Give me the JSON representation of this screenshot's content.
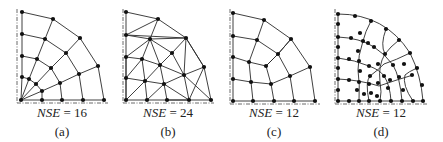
{
  "panels": [
    {
      "id": "a",
      "nse_label": "NSE",
      "nse_value": "= 16",
      "caption": "(a)",
      "label_center_x": 62
    },
    {
      "id": "b",
      "nse_label": "NSE",
      "nse_value": "= 24",
      "caption": "(b)",
      "label_center_x": 168
    },
    {
      "id": "c",
      "nse_label": "NSE",
      "nse_value": "= 12",
      "caption": "(c)",
      "label_center_x": 274
    },
    {
      "id": "d",
      "nse_label": "NSE",
      "nse_value": "= 12",
      "caption": "(d)",
      "label_center_x": 381
    }
  ],
  "meshes": {
    "a": {
      "axes": [
        [
          17,
          9,
          17,
          103
        ],
        [
          17,
          103,
          108,
          103
        ]
      ],
      "nodes": [
        [
          21,
          100
        ],
        [
          22,
          12
        ],
        [
          22,
          34
        ],
        [
          22,
          56
        ],
        [
          22,
          77
        ],
        [
          42,
          100
        ],
        [
          62,
          100
        ],
        [
          83,
          100
        ],
        [
          104,
          100
        ],
        [
          53,
          19
        ],
        [
          80,
          38
        ],
        [
          98,
          66
        ],
        [
          45,
          39
        ],
        [
          66,
          53
        ],
        [
          79,
          74
        ],
        [
          37,
          59
        ],
        [
          51,
          68
        ],
        [
          60,
          83
        ],
        [
          29,
          79
        ],
        [
          36,
          84
        ],
        [
          42,
          91
        ]
      ],
      "edges": [
        [
          1,
          2
        ],
        [
          2,
          3
        ],
        [
          3,
          4
        ],
        [
          4,
          0
        ],
        [
          0,
          5
        ],
        [
          5,
          6
        ],
        [
          6,
          7
        ],
        [
          7,
          8
        ],
        [
          1,
          9
        ],
        [
          9,
          10
        ],
        [
          10,
          11
        ],
        [
          11,
          8
        ],
        [
          2,
          12
        ],
        [
          12,
          13
        ],
        [
          13,
          14
        ],
        [
          14,
          7
        ],
        [
          3,
          15
        ],
        [
          15,
          16
        ],
        [
          16,
          17
        ],
        [
          17,
          6
        ],
        [
          4,
          18
        ],
        [
          18,
          19
        ],
        [
          19,
          20
        ],
        [
          20,
          5
        ],
        [
          9,
          12
        ],
        [
          12,
          15
        ],
        [
          15,
          18
        ],
        [
          18,
          0
        ],
        [
          10,
          13
        ],
        [
          13,
          16
        ],
        [
          16,
          19
        ],
        [
          19,
          0
        ],
        [
          11,
          14
        ],
        [
          14,
          17
        ],
        [
          17,
          20
        ],
        [
          20,
          0
        ]
      ]
    },
    "b": {
      "axes": [
        [
          123,
          9,
          123,
          103
        ],
        [
          123,
          103,
          214,
          103
        ]
      ],
      "nodes": [
        [
          126,
          12
        ],
        [
          126,
          35
        ],
        [
          126,
          57
        ],
        [
          126,
          78
        ],
        [
          126,
          100
        ],
        [
          147,
          100
        ],
        [
          167,
          100
        ],
        [
          189,
          100
        ],
        [
          211,
          100
        ],
        [
          158,
          19
        ],
        [
          186,
          38
        ],
        [
          204,
          67
        ],
        [
          150,
          39
        ],
        [
          172,
          53
        ],
        [
          142,
          59
        ],
        [
          160,
          65
        ],
        [
          184,
          75
        ],
        [
          145,
          81
        ],
        [
          164,
          84
        ]
      ],
      "edges": [
        [
          0,
          1
        ],
        [
          1,
          2
        ],
        [
          2,
          3
        ],
        [
          3,
          4
        ],
        [
          4,
          5
        ],
        [
          5,
          6
        ],
        [
          6,
          7
        ],
        [
          7,
          8
        ],
        [
          0,
          9
        ],
        [
          9,
          10
        ],
        [
          10,
          11
        ],
        [
          11,
          8
        ],
        [
          1,
          9
        ],
        [
          1,
          12
        ],
        [
          12,
          9
        ],
        [
          12,
          10
        ],
        [
          1,
          10
        ],
        [
          12,
          13
        ],
        [
          13,
          10
        ],
        [
          2,
          12
        ],
        [
          2,
          14
        ],
        [
          14,
          12
        ],
        [
          14,
          15
        ],
        [
          12,
          15
        ],
        [
          15,
          13
        ],
        [
          13,
          16
        ],
        [
          16,
          10
        ],
        [
          16,
          11
        ],
        [
          11,
          7
        ],
        [
          16,
          7
        ],
        [
          15,
          16
        ],
        [
          3,
          14
        ],
        [
          3,
          17
        ],
        [
          17,
          14
        ],
        [
          17,
          15
        ],
        [
          17,
          18
        ],
        [
          18,
          15
        ],
        [
          18,
          16
        ],
        [
          18,
          7
        ],
        [
          4,
          17
        ],
        [
          17,
          5
        ],
        [
          5,
          18
        ],
        [
          18,
          6
        ],
        [
          6,
          7
        ],
        [
          16,
          8
        ],
        [
          10,
          11
        ],
        [
          2,
          3
        ],
        [
          4,
          3
        ]
      ]
    },
    "c": {
      "axes": [
        [
          230,
          9,
          230,
          104
        ],
        [
          230,
          104,
          320,
          104
        ]
      ],
      "nodes": [
        [
          233,
          13
        ],
        [
          233,
          36
        ],
        [
          233,
          57
        ],
        [
          233,
          79
        ],
        [
          233,
          101
        ],
        [
          253,
          101
        ],
        [
          274,
          101
        ],
        [
          294,
          101
        ],
        [
          315,
          101
        ],
        [
          264,
          20
        ],
        [
          291,
          39
        ],
        [
          310,
          67
        ],
        [
          257,
          40
        ],
        [
          278,
          54
        ],
        [
          249,
          62
        ],
        [
          266,
          66
        ],
        [
          290,
          76
        ],
        [
          251,
          82
        ],
        [
          271,
          84
        ]
      ],
      "edges": [
        [
          0,
          1
        ],
        [
          1,
          2
        ],
        [
          2,
          3
        ],
        [
          3,
          4
        ],
        [
          4,
          5
        ],
        [
          5,
          6
        ],
        [
          6,
          7
        ],
        [
          7,
          8
        ],
        [
          0,
          9
        ],
        [
          9,
          10
        ],
        [
          10,
          11
        ],
        [
          11,
          8
        ],
        [
          1,
          12
        ],
        [
          12,
          13
        ],
        [
          13,
          10
        ],
        [
          2,
          14
        ],
        [
          14,
          15
        ],
        [
          15,
          13
        ],
        [
          3,
          17
        ],
        [
          17,
          18
        ],
        [
          18,
          16
        ],
        [
          16,
          11
        ],
        [
          9,
          12
        ],
        [
          12,
          14
        ],
        [
          14,
          17
        ],
        [
          17,
          5
        ],
        [
          13,
          15
        ],
        [
          15,
          18
        ],
        [
          18,
          6
        ],
        [
          10,
          13
        ],
        [
          13,
          16
        ],
        [
          16,
          7
        ]
      ]
    },
    "d": {
      "axes": [
        [
          335,
          9,
          335,
          104
        ],
        [
          335,
          104,
          427,
          104
        ]
      ],
      "nodes": [
        [
          338,
          14
        ],
        [
          338,
          24
        ],
        [
          338,
          37
        ],
        [
          338,
          47
        ],
        [
          338,
          58
        ],
        [
          338,
          68
        ],
        [
          338,
          79
        ],
        [
          338,
          90
        ],
        [
          338,
          101
        ],
        [
          349,
          101
        ],
        [
          359,
          101
        ],
        [
          369,
          101
        ],
        [
          380,
          101
        ],
        [
          391,
          101
        ],
        [
          402,
          101
        ],
        [
          413,
          101
        ],
        [
          423,
          101
        ],
        [
          355,
          16
        ],
        [
          371,
          21
        ],
        [
          386,
          29
        ],
        [
          399,
          40
        ],
        [
          410,
          53
        ],
        [
          417,
          68
        ],
        [
          422,
          85
        ],
        [
          351,
          38
        ],
        [
          363,
          41
        ],
        [
          374,
          47
        ],
        [
          360,
          33
        ],
        [
          368,
          43
        ],
        [
          385,
          54
        ],
        [
          393,
          65
        ],
        [
          399,
          77
        ],
        [
          403,
          90
        ],
        [
          349,
          59
        ],
        [
          359,
          61
        ],
        [
          369,
          66
        ],
        [
          378,
          64
        ],
        [
          384,
          76
        ],
        [
          388,
          88
        ],
        [
          349,
          80
        ],
        [
          359,
          82
        ],
        [
          378,
          83
        ],
        [
          369,
          84
        ],
        [
          390,
          80
        ],
        [
          357,
          90
        ],
        [
          360,
          71
        ],
        [
          358,
          51
        ],
        [
          364,
          94
        ],
        [
          371,
          93
        ],
        [
          370,
          76
        ],
        [
          404,
          64
        ],
        [
          412,
          75
        ],
        [
          377,
          96
        ]
      ],
      "paths": [
        "M338,14 Q385,14 410,53 Q421,75 423,101",
        "M338,37 Q360,38 374,47 Q385,54 393,65 Q400,77 402,101",
        "M338,58 Q355,60 369,66 Q380,70 384,76 Q390,85 391,101",
        "M338,79 Q360,80 379,86 Q396,80 413,75",
        "M371,21 Q365,32 363,41 Q358,55 358,70 Q360,85 359,101",
        "M386,29 Q380,45 385,54 Q378,65 380,82 Q382,92 380,101",
        "M338,101 L423,101",
        "M338,14 L338,101",
        "M399,40 Q390,47 385,54",
        "M410,53 Q396,60 384,64 Q378,70 370,76 Q365,82 369,101",
        "M417,68 Q408,72 405,75 Q402,85 413,101"
      ]
    }
  }
}
